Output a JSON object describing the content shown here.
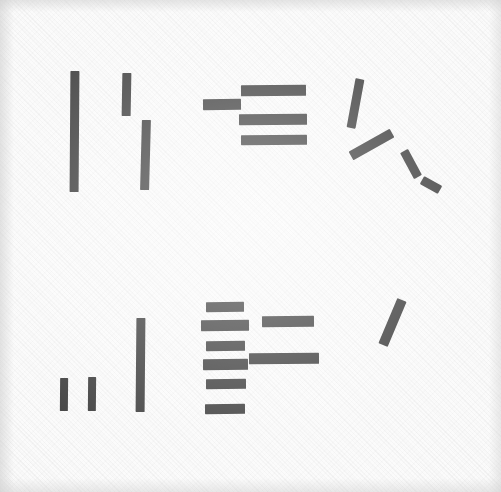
{
  "image": {
    "title": "Handwritten stroke marks on textured paper",
    "width": 501,
    "height": 492,
    "background_color": "#fafafa",
    "ink_color": "#111111",
    "surface": "woven paper texture with faint diagonal weave",
    "caption": ""
  },
  "chart_data": {
    "type": "scatter",
    "xlabel": "",
    "ylabel": "",
    "xlim": [
      0,
      501
    ],
    "ylim": [
      0,
      492
    ],
    "grid": false,
    "legend": "none",
    "note": "Each datum is one ink stroke described by its bounding geometry in pixel coordinates.",
    "groups": [
      {
        "name": "upper-left-verticals",
        "strokes": [
          {
            "id": "ul-v1",
            "kind": "vertical-bar",
            "x": 70,
            "y": 71,
            "w": 9,
            "h": 121,
            "rotate": 0.4
          },
          {
            "id": "ul-v2",
            "kind": "vertical-bar",
            "x": 122,
            "y": 73,
            "w": 9,
            "h": 43,
            "rotate": 1.0
          },
          {
            "id": "ul-v3",
            "kind": "vertical-bar",
            "x": 141,
            "y": 120,
            "w": 9,
            "h": 70,
            "rotate": 1.5
          }
        ]
      },
      {
        "name": "upper-middle-horizontals",
        "strokes": [
          {
            "id": "um-h0",
            "kind": "horizontal-bar",
            "x": 203,
            "y": 99,
            "w": 38,
            "h": 11,
            "rotate": -0.5
          },
          {
            "id": "um-h1",
            "kind": "horizontal-bar",
            "x": 241,
            "y": 85,
            "w": 65,
            "h": 11,
            "rotate": -0.4
          },
          {
            "id": "um-h2",
            "kind": "horizontal-bar",
            "x": 239,
            "y": 114,
            "w": 68,
            "h": 11,
            "rotate": -0.3
          },
          {
            "id": "um-h3",
            "kind": "horizontal-bar",
            "x": 241,
            "y": 135,
            "w": 66,
            "h": 10,
            "rotate": -0.3
          }
        ]
      },
      {
        "name": "upper-right-diagonals",
        "strokes": [
          {
            "id": "ur-d1",
            "kind": "diagonal-stroke",
            "x1": 360,
            "y1": 79,
            "x2": 351,
            "y2": 128,
            "w": 9
          },
          {
            "id": "ur-d2",
            "kind": "diagonal-stroke",
            "x1": 392,
            "y1": 133,
            "x2": 351,
            "y2": 156,
            "w": 10
          },
          {
            "id": "ur-d3",
            "kind": "diagonal-stroke",
            "x1": 404,
            "y1": 151,
            "x2": 418,
            "y2": 177,
            "w": 9
          },
          {
            "id": "ur-d4",
            "kind": "diagonal-stroke",
            "x1": 422,
            "y1": 180,
            "x2": 440,
            "y2": 190,
            "w": 9
          }
        ]
      },
      {
        "name": "lower-left-verticals",
        "strokes": [
          {
            "id": "ll-v1",
            "kind": "vertical-bar",
            "x": 60,
            "y": 378,
            "w": 8,
            "h": 33,
            "rotate": 0.5
          },
          {
            "id": "ll-v2",
            "kind": "vertical-bar",
            "x": 88,
            "y": 377,
            "w": 8,
            "h": 34,
            "rotate": 0.5
          },
          {
            "id": "ll-v3",
            "kind": "vertical-bar",
            "x": 136,
            "y": 318,
            "w": 9,
            "h": 94,
            "rotate": 0.5
          }
        ]
      },
      {
        "name": "lower-middle-bar-stack",
        "strokes": [
          {
            "id": "lm-h1",
            "kind": "horizontal-bar",
            "x": 206,
            "y": 302,
            "w": 38,
            "h": 10,
            "rotate": -0.4
          },
          {
            "id": "lm-h2",
            "kind": "horizontal-bar",
            "x": 201,
            "y": 320,
            "w": 48,
            "h": 11,
            "rotate": -0.4
          },
          {
            "id": "lm-h3",
            "kind": "horizontal-bar",
            "x": 206,
            "y": 341,
            "w": 39,
            "h": 10,
            "rotate": -0.4
          },
          {
            "id": "lm-h4",
            "kind": "horizontal-bar",
            "x": 203,
            "y": 359,
            "w": 45,
            "h": 11,
            "rotate": -0.4
          },
          {
            "id": "lm-h5",
            "kind": "horizontal-bar",
            "x": 206,
            "y": 379,
            "w": 40,
            "h": 10,
            "rotate": -0.4
          },
          {
            "id": "lm-h6",
            "kind": "horizontal-bar",
            "x": 205,
            "y": 404,
            "w": 40,
            "h": 10,
            "rotate": -0.4
          }
        ]
      },
      {
        "name": "lower-right-horizontals",
        "strokes": [
          {
            "id": "lr-h1",
            "kind": "horizontal-bar",
            "x": 262,
            "y": 316,
            "w": 52,
            "h": 11,
            "rotate": -0.4
          },
          {
            "id": "lr-h2",
            "kind": "horizontal-bar",
            "x": 249,
            "y": 353,
            "w": 70,
            "h": 11,
            "rotate": -0.4
          }
        ]
      },
      {
        "name": "lower-right-diagonal",
        "strokes": [
          {
            "id": "lr-d1",
            "kind": "diagonal-stroke",
            "x1": 402,
            "y1": 300,
            "x2": 383,
            "y2": 345,
            "w": 10
          }
        ]
      }
    ]
  }
}
